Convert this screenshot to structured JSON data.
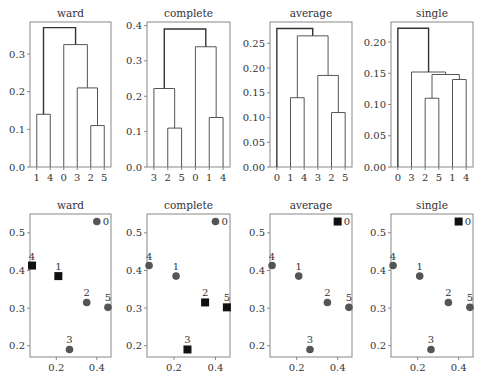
{
  "chart_data": [
    {
      "type": "dendrogram",
      "title": "ward",
      "leaf_order": [
        "1",
        "4",
        "0",
        "3",
        "2",
        "5"
      ],
      "ylim": [
        0,
        0.385
      ],
      "yticks": [
        0.0,
        0.1,
        0.2,
        0.3
      ],
      "ytick_labels": [
        "0.0",
        "0.1",
        "0.2",
        "0.3"
      ],
      "merges": [
        {
          "left": "2",
          "right": "5",
          "height": 0.11
        },
        {
          "left": "1",
          "right": "4",
          "height": 0.14
        },
        {
          "left": "3",
          "right": "(2,5)",
          "height": 0.21
        },
        {
          "left": "0",
          "right": "(3,2,5)",
          "height": 0.325
        },
        {
          "left": "(1,4)",
          "right": "(0,3,2,5)",
          "height": 0.37
        }
      ]
    },
    {
      "type": "dendrogram",
      "title": "complete",
      "leaf_order": [
        "3",
        "2",
        "5",
        "0",
        "1",
        "4"
      ],
      "ylim": [
        0,
        0.41
      ],
      "yticks": [
        0.0,
        0.1,
        0.2,
        0.3,
        0.4
      ],
      "ytick_labels": [
        "0.0",
        "0.1",
        "0.2",
        "0.3",
        "0.4"
      ],
      "merges": [
        {
          "left": "2",
          "right": "5",
          "height": 0.11
        },
        {
          "left": "1",
          "right": "4",
          "height": 0.14
        },
        {
          "left": "3",
          "right": "(2,5)",
          "height": 0.222
        },
        {
          "left": "0",
          "right": "(1,4)",
          "height": 0.34
        },
        {
          "left": "(3,2,5)",
          "right": "(0,1,4)",
          "height": 0.39
        }
      ]
    },
    {
      "type": "dendrogram",
      "title": "average",
      "leaf_order": [
        "0",
        "1",
        "4",
        "3",
        "2",
        "5"
      ],
      "ylim": [
        0,
        0.293
      ],
      "yticks": [
        0.0,
        0.05,
        0.1,
        0.15,
        0.2,
        0.25
      ],
      "ytick_labels": [
        "0.00",
        "0.05",
        "0.10",
        "0.15",
        "0.20",
        "0.25"
      ],
      "merges": [
        {
          "left": "2",
          "right": "5",
          "height": 0.11
        },
        {
          "left": "1",
          "right": "4",
          "height": 0.14
        },
        {
          "left": "3",
          "right": "(2,5)",
          "height": 0.185
        },
        {
          "left": "(1,4)",
          "right": "(3,2,5)",
          "height": 0.265
        },
        {
          "left": "0",
          "right": "(1,4,3,2,5)",
          "height": 0.28
        }
      ]
    },
    {
      "type": "dendrogram",
      "title": "single",
      "leaf_order": [
        "0",
        "3",
        "2",
        "5",
        "1",
        "4"
      ],
      "ylim": [
        0,
        0.232
      ],
      "yticks": [
        0.0,
        0.05,
        0.1,
        0.15,
        0.2
      ],
      "ytick_labels": [
        "0.00",
        "0.05",
        "0.10",
        "0.15",
        "0.20"
      ],
      "merges": [
        {
          "left": "2",
          "right": "5",
          "height": 0.11
        },
        {
          "left": "1",
          "right": "4",
          "height": 0.14
        },
        {
          "left": "(2,5)",
          "right": "(1,4)",
          "height": 0.148
        },
        {
          "left": "3",
          "right": "(2,5,1,4)",
          "height": 0.152
        },
        {
          "left": "0",
          "right": "(3,2,5,1,4)",
          "height": 0.222
        }
      ]
    },
    {
      "type": "scatter",
      "title": "ward",
      "xlim": [
        0.07,
        0.47
      ],
      "ylim": [
        0.17,
        0.55
      ],
      "xticks": [
        0.2,
        0.4
      ],
      "xtick_labels": [
        "0.2",
        "0.4"
      ],
      "yticks": [
        0.2,
        0.3,
        0.4,
        0.5
      ],
      "ytick_labels": [
        "0.2",
        "0.3",
        "0.4",
        "0.5"
      ],
      "points": [
        {
          "label": "0",
          "x": 0.4,
          "y": 0.53,
          "marker": "circle"
        },
        {
          "label": "1",
          "x": 0.21,
          "y": 0.385,
          "marker": "square"
        },
        {
          "label": "2",
          "x": 0.35,
          "y": 0.315,
          "marker": "circle"
        },
        {
          "label": "3",
          "x": 0.265,
          "y": 0.19,
          "marker": "circle"
        },
        {
          "label": "4",
          "x": 0.08,
          "y": 0.413,
          "marker": "square"
        },
        {
          "label": "5",
          "x": 0.455,
          "y": 0.302,
          "marker": "circle"
        }
      ]
    },
    {
      "type": "scatter",
      "title": "complete",
      "xlim": [
        0.07,
        0.47
      ],
      "ylim": [
        0.17,
        0.55
      ],
      "xticks": [
        0.2,
        0.4
      ],
      "xtick_labels": [
        "0.2",
        "0.4"
      ],
      "yticks": [
        0.2,
        0.3,
        0.4,
        0.5
      ],
      "ytick_labels": [
        "0.2",
        "0.3",
        "0.4",
        "0.5"
      ],
      "points": [
        {
          "label": "0",
          "x": 0.4,
          "y": 0.53,
          "marker": "circle"
        },
        {
          "label": "1",
          "x": 0.21,
          "y": 0.385,
          "marker": "circle"
        },
        {
          "label": "2",
          "x": 0.35,
          "y": 0.315,
          "marker": "square"
        },
        {
          "label": "3",
          "x": 0.265,
          "y": 0.19,
          "marker": "square"
        },
        {
          "label": "4",
          "x": 0.08,
          "y": 0.413,
          "marker": "circle"
        },
        {
          "label": "5",
          "x": 0.455,
          "y": 0.302,
          "marker": "square"
        }
      ]
    },
    {
      "type": "scatter",
      "title": "average",
      "xlim": [
        0.07,
        0.47
      ],
      "ylim": [
        0.17,
        0.55
      ],
      "xticks": [
        0.2,
        0.4
      ],
      "xtick_labels": [
        "0.2",
        "0.4"
      ],
      "yticks": [
        0.2,
        0.3,
        0.4,
        0.5
      ],
      "ytick_labels": [
        "0.2",
        "0.3",
        "0.4",
        "0.5"
      ],
      "points": [
        {
          "label": "0",
          "x": 0.4,
          "y": 0.53,
          "marker": "square"
        },
        {
          "label": "1",
          "x": 0.21,
          "y": 0.385,
          "marker": "circle"
        },
        {
          "label": "2",
          "x": 0.35,
          "y": 0.315,
          "marker": "circle"
        },
        {
          "label": "3",
          "x": 0.265,
          "y": 0.19,
          "marker": "circle"
        },
        {
          "label": "4",
          "x": 0.08,
          "y": 0.413,
          "marker": "circle"
        },
        {
          "label": "5",
          "x": 0.455,
          "y": 0.302,
          "marker": "circle"
        }
      ]
    },
    {
      "type": "scatter",
      "title": "single",
      "xlim": [
        0.07,
        0.47
      ],
      "ylim": [
        0.17,
        0.55
      ],
      "xticks": [
        0.2,
        0.4
      ],
      "xtick_labels": [
        "0.2",
        "0.4"
      ],
      "yticks": [
        0.2,
        0.3,
        0.4,
        0.5
      ],
      "ytick_labels": [
        "0.2",
        "0.3",
        "0.4",
        "0.5"
      ],
      "points": [
        {
          "label": "0",
          "x": 0.4,
          "y": 0.53,
          "marker": "square"
        },
        {
          "label": "1",
          "x": 0.21,
          "y": 0.385,
          "marker": "circle"
        },
        {
          "label": "2",
          "x": 0.35,
          "y": 0.315,
          "marker": "circle"
        },
        {
          "label": "3",
          "x": 0.265,
          "y": 0.19,
          "marker": "circle"
        },
        {
          "label": "4",
          "x": 0.08,
          "y": 0.413,
          "marker": "circle"
        },
        {
          "label": "5",
          "x": 0.455,
          "y": 0.302,
          "marker": "circle"
        }
      ]
    }
  ],
  "colors": {
    "axes_frame": "#888888",
    "tick_text": "#333333",
    "dendrogram_top_link": "#333333",
    "dendrogram_link": "#555555",
    "point_circle": "#555555",
    "point_square": "#111111"
  }
}
